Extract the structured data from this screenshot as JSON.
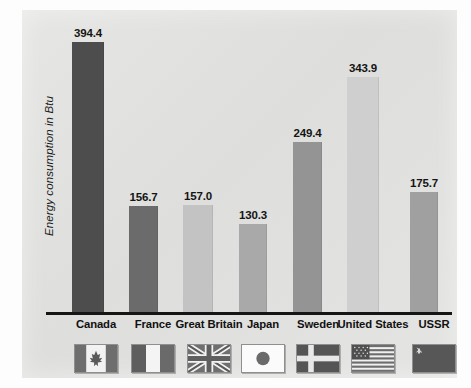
{
  "chart_data": {
    "type": "bar",
    "title": "",
    "subtitle": "",
    "xlabel": "",
    "ylabel": "Energy consumption in Btu",
    "ylim": [
      0,
      430
    ],
    "grid": false,
    "legend": "none",
    "categories": [
      "Canada",
      "France",
      "Great Britain",
      "Japan",
      "Sweden",
      "United States",
      "USSR"
    ],
    "values": [
      394.4,
      156.7,
      157.0,
      130.3,
      249.4,
      343.9,
      175.7
    ],
    "value_labels": [
      "394.4",
      "156.7",
      "157.0",
      "130.3",
      "249.4",
      "343.9",
      "175.7"
    ],
    "bar_colors": [
      "#4d4d4d",
      "#6b6b6b",
      "#c3c3c3",
      "#a9a9a9",
      "#949494",
      "#cfcfcf",
      "#a0a0a0"
    ],
    "annotations": []
  },
  "figure": {
    "panel_color": "#e2e2e0",
    "axis_color": "#151515",
    "label_color": "#111111"
  },
  "axis": {
    "y_title": "Energy consumption in Btu"
  },
  "categories": [
    {
      "label": "Canada",
      "value": 394.4,
      "value_label": "394.4",
      "flag": "flag-canada"
    },
    {
      "label": "France",
      "value": 156.7,
      "value_label": "156.7",
      "flag": "flag-france"
    },
    {
      "label": "Great Britain",
      "value": 157.0,
      "value_label": "157.0",
      "flag": "flag-great-britain"
    },
    {
      "label": "Japan",
      "value": 130.3,
      "value_label": "130.3",
      "flag": "flag-japan"
    },
    {
      "label": "Sweden",
      "value": 249.4,
      "value_label": "249.4",
      "flag": "flag-sweden"
    },
    {
      "label": "United States",
      "value": 343.9,
      "value_label": "343.9",
      "flag": "flag-united-states"
    },
    {
      "label": "USSR",
      "value": 175.7,
      "value_label": "175.7",
      "flag": "flag-ussr"
    }
  ]
}
